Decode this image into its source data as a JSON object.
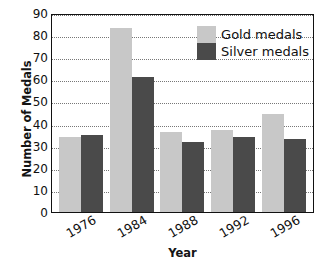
{
  "chart_data": {
    "type": "bar",
    "title": "",
    "subtitle": "",
    "xlabel": "Year",
    "ylabel": "Number of Medals",
    "categories": [
      "1976",
      "1984",
      "1988",
      "1992",
      "1996"
    ],
    "series": [
      {
        "name": "Gold medals",
        "color": "#c8c8c8",
        "values": [
          34,
          83,
          36,
          37,
          44.5
        ]
      },
      {
        "name": "Silver medals",
        "color": "#4a4a4a",
        "values": [
          35,
          61,
          31.5,
          34,
          33
        ]
      }
    ],
    "ylim": [
      0,
      90
    ],
    "ytick_labels": [
      "0",
      "10",
      "20",
      "30",
      "40",
      "50",
      "60",
      "70",
      "80",
      "90"
    ],
    "ytick_values": [
      0,
      10,
      20,
      30,
      40,
      50,
      60,
      70,
      80,
      90
    ],
    "grid": true,
    "grid_axis": "y",
    "grid_style": "dotted",
    "legend_position": "top-right",
    "xtick_rotation": -30,
    "plot_border": "#111111",
    "background": "#ffffff"
  }
}
